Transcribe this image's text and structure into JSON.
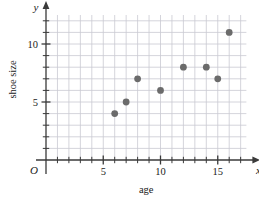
{
  "chart_data": {
    "type": "scatter",
    "title": "",
    "xlabel": "age",
    "ylabel": "shoe size",
    "x_axis_letter": "x",
    "y_axis_letter": "y",
    "origin_label": "O",
    "xlim": [
      0,
      17.5
    ],
    "ylim": [
      0,
      12.5
    ],
    "xticks": [
      5,
      10,
      15
    ],
    "xticklabels": [
      "5",
      "10",
      "15"
    ],
    "yticks": [
      5,
      10
    ],
    "yticklabels": [
      "5",
      "10"
    ],
    "x_minor_step": 1,
    "y_minor_step": 1,
    "grid": true,
    "legend": "none",
    "marker_color": "#6b6b6b",
    "grid_color": "#c9c9d2",
    "axis_color": "#3a3a3a",
    "points": [
      {
        "x": 6,
        "y": 4
      },
      {
        "x": 7,
        "y": 5
      },
      {
        "x": 8,
        "y": 7
      },
      {
        "x": 10,
        "y": 6
      },
      {
        "x": 12,
        "y": 8
      },
      {
        "x": 14,
        "y": 8
      },
      {
        "x": 15,
        "y": 7
      },
      {
        "x": 16,
        "y": 11
      }
    ]
  }
}
